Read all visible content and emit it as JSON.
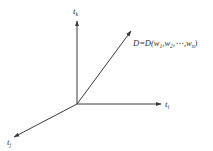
{
  "diagram": {
    "type": "vector-space-axes",
    "colors": {
      "stroke": "#3a3a3a",
      "text": "#333333",
      "background": "#ffffff"
    },
    "axes": [
      {
        "id": "t_k",
        "label": "t",
        "subscript": "k",
        "direction": "up"
      },
      {
        "id": "t_i",
        "label": "t",
        "subscript": "i",
        "direction": "right"
      },
      {
        "id": "t_j",
        "label": "t",
        "subscript": "j",
        "direction": "down-left"
      }
    ],
    "vector": {
      "label_prefix": "D=D(w",
      "sub1": "1",
      "sep1": ",w",
      "sub2": "2",
      "sep2": ",⋯,w",
      "subn": "n",
      "suffix": ")"
    }
  }
}
